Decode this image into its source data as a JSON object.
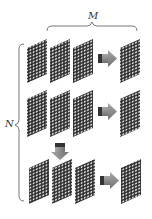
{
  "labels": {
    "m": "M",
    "n": "N"
  },
  "colors": {
    "panel_dark": "#2a2a2a",
    "dot": "#d8d8d8",
    "arrow_fill": "#8a8a8a",
    "arrow_dark": "#3a3a3a",
    "brace": "#555555"
  },
  "rows": [
    {
      "inputs": 3,
      "arrow": "right",
      "output": 1
    },
    {
      "inputs": 3,
      "arrow": "right",
      "output": 1
    },
    {
      "inputs": 3,
      "arrow": "right",
      "output": 1,
      "down_arrow_above_input": 2
    }
  ]
}
